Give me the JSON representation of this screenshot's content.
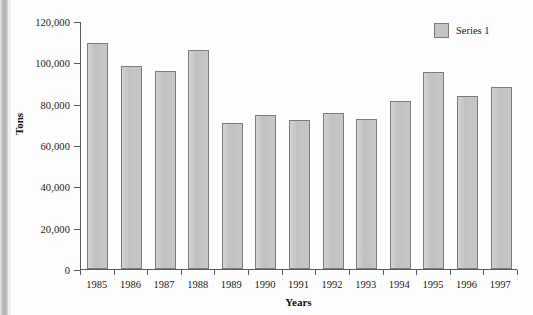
{
  "chart_data": {
    "type": "bar",
    "title": "",
    "subtitle": "",
    "xlabel": "Years",
    "ylabel": "Tons",
    "categories": [
      "1985",
      "1986",
      "1987",
      "1988",
      "1989",
      "1990",
      "1991",
      "1992",
      "1993",
      "1994",
      "1995",
      "1996",
      "1997"
    ],
    "values": [
      109500,
      98300,
      96000,
      106000,
      70800,
      74500,
      72000,
      75500,
      72500,
      81500,
      95200,
      83500,
      88000
    ],
    "series": [
      {
        "name": "Series 1",
        "values": [
          109500,
          98300,
          96000,
          106000,
          70800,
          74500,
          72000,
          75500,
          72500,
          81500,
          95200,
          83500,
          88000
        ]
      }
    ],
    "ylim": [
      0,
      120000
    ],
    "yticks": [
      0,
      20000,
      40000,
      60000,
      80000,
      100000,
      120000
    ],
    "ytick_labels": [
      "0",
      "20,000",
      "40,000",
      "60,000",
      "80,000",
      "100,000",
      "120,000"
    ],
    "grid": false,
    "legend": {
      "position": "top-right",
      "entries": [
        {
          "label": "Series 1",
          "color": "#c4c4c4"
        }
      ]
    },
    "colors": {
      "bar_fill": "#c4c4c4",
      "bar_border": "#7d7d7d",
      "axis": "#5b5b5b",
      "text": "#1a1a1a",
      "background": "#fdfdfd"
    }
  }
}
